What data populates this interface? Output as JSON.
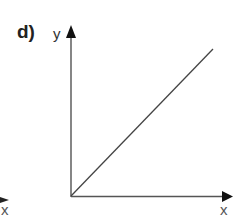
{
  "diagram": {
    "panel_label": "d)",
    "y_axis_label": "y",
    "x_axis_label": "x",
    "prev_panel_x_axis_label": "x",
    "relationship": "linear, directly proportional (straight line through origin)",
    "colors": {
      "axis": "#222222",
      "line": "#444444"
    }
  }
}
